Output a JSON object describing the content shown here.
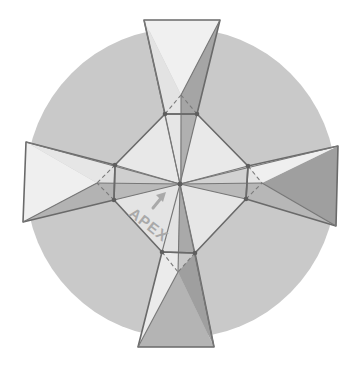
{
  "diagram": {
    "label": "APEX",
    "arrow_icon": "arrow-up-right",
    "colors": {
      "background": "#ffffff",
      "circle": "#c9c9c9",
      "light_face": "#eeeeee",
      "mid_face": "#dcdcdc",
      "dark_face": "#a8a8a8",
      "edge": "#6a6a6a",
      "label": "#a9a9a9"
    },
    "circle": {
      "cx": 181,
      "cy": 183,
      "r": 155
    },
    "apex": {
      "x": 180,
      "y": 184
    },
    "octagon_vertices": [
      [
        165,
        114
      ],
      [
        197,
        114
      ],
      [
        248,
        166
      ],
      [
        246,
        199
      ],
      [
        195,
        253
      ],
      [
        162,
        252
      ],
      [
        114,
        200
      ],
      [
        115,
        165
      ]
    ],
    "arms": [
      {
        "name": "top",
        "outer": [
          [
            144,
            20
          ],
          [
            220,
            20
          ]
        ],
        "inner": [
          [
            197,
            114
          ],
          [
            165,
            114
          ]
        ],
        "fold_point": [
          181,
          95
        ]
      },
      {
        "name": "right",
        "outer": [
          [
            338,
            146
          ],
          [
            336,
            226
          ]
        ],
        "inner": [
          [
            246,
            199
          ],
          [
            248,
            166
          ]
        ],
        "fold_point": [
          262,
          183
        ]
      },
      {
        "name": "bottom",
        "outer": [
          [
            214,
            347
          ],
          [
            138,
            347
          ]
        ],
        "inner": [
          [
            162,
            252
          ],
          [
            195,
            253
          ]
        ],
        "fold_point": [
          178,
          272
        ]
      },
      {
        "name": "left",
        "outer": [
          [
            23,
            222
          ],
          [
            26,
            142
          ]
        ],
        "inner": [
          [
            115,
            165
          ],
          [
            114,
            200
          ]
        ],
        "fold_point": [
          97,
          183
        ]
      }
    ]
  }
}
